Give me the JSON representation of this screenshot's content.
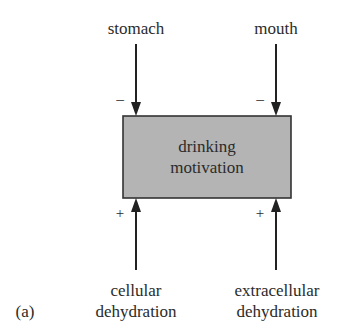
{
  "diagram": {
    "panel_label": "(a)",
    "center_node": {
      "line1": "drinking",
      "line2": "motivation",
      "fill": "#b4b4b4",
      "border": "#333333"
    },
    "inputs_top": [
      {
        "label": "stomach",
        "sign": "−"
      },
      {
        "label": "mouth",
        "sign": "−"
      }
    ],
    "inputs_bottom": [
      {
        "label_line1": "cellular",
        "label_line2": "dehydration",
        "sign": "+"
      },
      {
        "label_line1": "extracellular",
        "label_line2": "dehydration",
        "sign": "+"
      }
    ],
    "colors": {
      "text": "#2b2b2b",
      "arrow": "#222222"
    }
  }
}
